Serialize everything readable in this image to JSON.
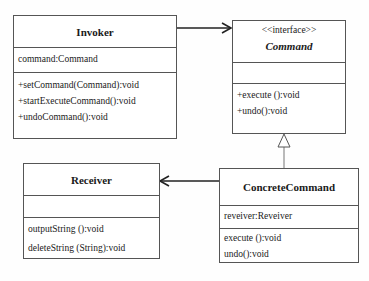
{
  "diagram": {
    "type": "UML class diagram",
    "pattern": "Command",
    "classes": {
      "invoker": {
        "name": "Invoker",
        "attributes": [
          "command:Command"
        ],
        "methods": [
          "+setCommand(Command):void",
          "+startExecuteCommand():void",
          "+undoCommand():void"
        ]
      },
      "command": {
        "stereotype": "<<interface>>",
        "name": "Command",
        "attributes": [],
        "methods": [
          "+execute ():void",
          "+undo():void"
        ]
      },
      "receiver": {
        "name": "Receiver",
        "attributes": [],
        "methods": [
          "outputString ():void",
          "deleteString (String):void"
        ]
      },
      "concrete_command": {
        "name": "ConcreteCommand",
        "attributes": [
          "reveiver:Reveiver"
        ],
        "methods": [
          "execute ():void",
          "undo():void"
        ]
      }
    },
    "relationships": [
      {
        "from": "Invoker",
        "to": "Command",
        "type": "association"
      },
      {
        "from": "ConcreteCommand",
        "to": "Command",
        "type": "realization"
      },
      {
        "from": "ConcreteCommand",
        "to": "Receiver",
        "type": "association"
      }
    ]
  }
}
